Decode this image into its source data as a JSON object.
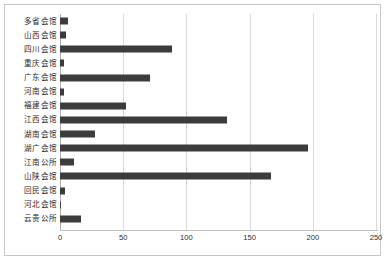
{
  "chart_data": {
    "type": "bar",
    "orientation": "horizontal",
    "title": "",
    "subtitle": "",
    "xlabel": "",
    "ylabel": "",
    "xlim": [
      0,
      250
    ],
    "ylim": null,
    "grid": "vertical",
    "legend": null,
    "legend_position": "none",
    "bar_color": "#3c3c3c",
    "grid_color": "#d9d9d9",
    "xticks": [
      0,
      50,
      100,
      150,
      200,
      250
    ],
    "xtick_labels": [
      "0",
      "50",
      "100",
      "150",
      "200",
      "250"
    ],
    "categories": [
      "多省会馆",
      "山西会馆",
      "四川会馆",
      "重庆会馆",
      "广东会馆",
      "河南会馆",
      "福建会馆",
      "江西会馆",
      "湖南会馆",
      "湖广会馆",
      "江南公所",
      "山陕会馆",
      "回民会馆",
      "河北会馆",
      "云贵公所"
    ],
    "values": [
      6,
      5,
      89,
      3,
      71,
      3,
      52,
      132,
      28,
      196,
      11,
      167,
      4,
      1,
      17
    ]
  }
}
